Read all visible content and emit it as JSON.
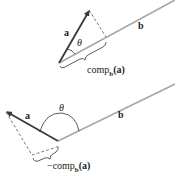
{
  "colors": {
    "vector_a": "#3a3a3a",
    "vector_b": "#a8a8a8",
    "dashed": "#555555",
    "text": "#222222"
  },
  "top_diagram": {
    "label_a": "a",
    "label_b": "b",
    "label_theta": "θ",
    "projection_label_prefix": "comp",
    "projection_label_sub": "b",
    "projection_label_arg": "(a)"
  },
  "bottom_diagram": {
    "label_a": "a",
    "label_b": "b",
    "label_theta": "θ",
    "projection_label_prefix": "−comp",
    "projection_label_sub": "b",
    "projection_label_arg": "(a)"
  }
}
